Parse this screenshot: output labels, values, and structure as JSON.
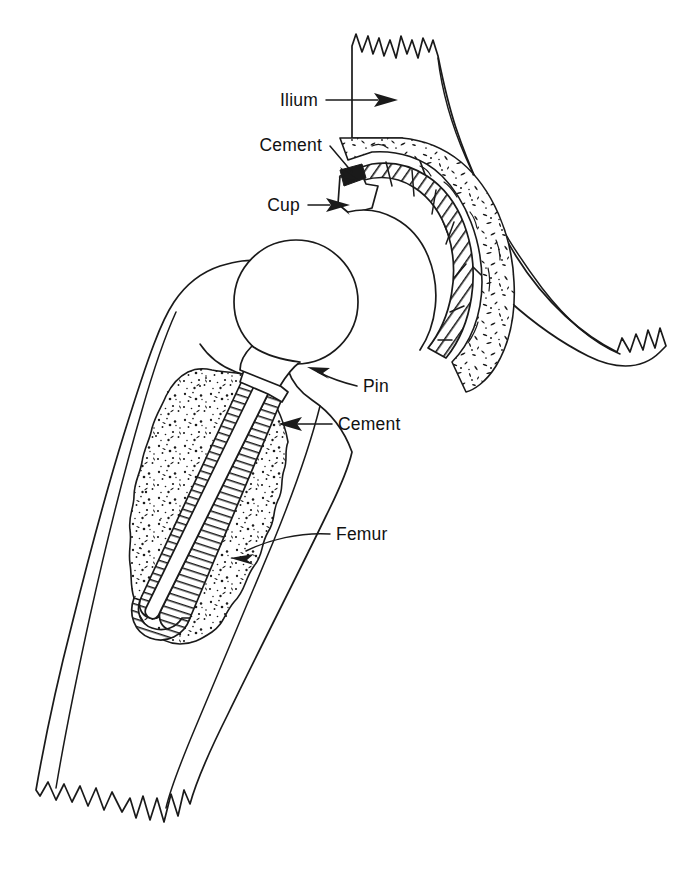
{
  "figure": {
    "style": "black-and-white line drawing",
    "background_color": "#ffffff",
    "line_color": "#1a1a1a"
  },
  "labels": [
    {
      "id": "ilium",
      "text": "Ilium",
      "text_x": 318,
      "text_y": 106,
      "anchor": "end",
      "leader": "M 326 100 L 378 100",
      "arrow_tip_x": 398,
      "arrow_tip_y": 100,
      "arrow_angle": 0,
      "points_to": "iliac bone body"
    },
    {
      "id": "cement-acetabular",
      "text": "Cement",
      "text_x": 322,
      "text_y": 151,
      "anchor": "end",
      "leader": "M 330 146 L 352 172",
      "arrow_tip_x": 360,
      "arrow_tip_y": 181,
      "arrow_angle": 49,
      "points_to": "acetabular cement mantle"
    },
    {
      "id": "cup",
      "text": "Cup",
      "text_x": 300,
      "text_y": 211,
      "anchor": "end",
      "leader": "M 308 205 L 330 205",
      "arrow_tip_x": 350,
      "arrow_tip_y": 205,
      "arrow_angle": 0,
      "points_to": "acetabular cup component"
    },
    {
      "id": "pin",
      "text": "Pin",
      "text_x": 363,
      "text_y": 392,
      "anchor": "start",
      "leader": "M 357 386 C 340 382 330 378 318 372",
      "arrow_tip_x": 307,
      "arrow_tip_y": 367,
      "arrow_angle": 206,
      "points_to": "femoral head / neck pin"
    },
    {
      "id": "cement-femoral",
      "text": "Cement",
      "text_x": 338,
      "text_y": 430,
      "anchor": "start",
      "leader": "M 332 424 L 296 424",
      "arrow_tip_x": 278,
      "arrow_tip_y": 424,
      "arrow_angle": 180,
      "points_to": "femoral cement mantle"
    },
    {
      "id": "femur",
      "text": "Femur",
      "text_x": 336,
      "text_y": 540,
      "anchor": "start",
      "leader": "M 330 534 C 300 532 268 540 246 551",
      "arrow_tip_x": 230,
      "arrow_tip_y": 558,
      "arrow_angle": 206,
      "points_to": "femoral shaft cortical bone"
    }
  ],
  "structures": {
    "ilium": {
      "name": "Ilium",
      "fill": "#ffffff",
      "edge": "jagged cut edge at top and lower right"
    },
    "acetabular_cement": {
      "name": "Cement",
      "fill": "stipple",
      "note": "speckled mantle around cup"
    },
    "acetabular_cup": {
      "name": "Cup",
      "fill": "diagonal-hatch",
      "note": "hatched arc band with flanged lip"
    },
    "femoral_head": {
      "name": "Prosthetic head",
      "fill": "#ffffff",
      "note": "circular ball"
    },
    "femoral_stem": {
      "name": "Stem / Pin",
      "fill": "cross-hatch",
      "note": "ladder-hatched rails with white core"
    },
    "femoral_cement": {
      "name": "Cement",
      "fill": "stipple",
      "note": "speckled mantle in medullary canal"
    },
    "femur": {
      "name": "Femur",
      "fill": "#ffffff",
      "edge": "jagged cut edge at bottom of shaft"
    }
  }
}
